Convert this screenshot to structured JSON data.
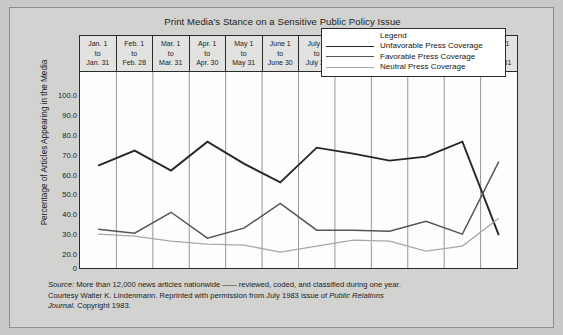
{
  "chart_data": {
    "type": "line",
    "title": "Print Media's Stance on a Sensitive Public Policy Issue",
    "xlabel": "",
    "ylabel": "Percentage of Articles Appearing in the Media",
    "ylim": [
      0,
      100
    ],
    "yticks": [
      "0",
      "20.0",
      "30.0",
      "40.0",
      "50.0",
      "60.0",
      "70.0",
      "80.0",
      "90.0",
      "100.0"
    ],
    "grid": "vertical",
    "legend_position": "inside-top-right",
    "legend_title": "Legend",
    "categories": [
      "Jan. 1 to Jan. 31",
      "Feb. 1 to Feb. 28",
      "Mar. 1 to Mar. 31",
      "Apr. 1 to Apr. 30",
      "May 1 to May 31",
      "June 1 to June 30",
      "July 1 to July 31",
      "Aug. 1 to Aug. 31",
      "Sept. 1 to Sept. 30",
      "Oct. 1 to Oct. 31",
      "Nov. 1 to Nov. 30",
      "Dec. 1 to Dec. 31"
    ],
    "series": [
      {
        "name": "Unfavorable Press Coverage",
        "color": "#262626",
        "values": [
          65.0,
          72.5,
          62.5,
          77.0,
          66.0,
          56.5,
          74.0,
          71.0,
          67.5,
          69.5,
          77.0,
          30.0
        ]
      },
      {
        "name": "Favorable Press Coverage",
        "color": "#545454",
        "values": [
          33.0,
          31.0,
          41.5,
          28.5,
          33.5,
          46.0,
          32.5,
          32.5,
          32.0,
          37.0,
          30.5,
          67.0
        ]
      },
      {
        "name": "Neutral Press Coverage",
        "color": "#a8a8a8",
        "values": [
          30.5,
          29.5,
          27.0,
          25.5,
          25.0,
          21.5,
          24.5,
          27.5,
          27.0,
          22.0,
          24.5,
          38.5
        ]
      }
    ]
  },
  "header": {
    "months": [
      {
        "line1": "Jan. 1",
        "line2": "to",
        "line3": "Jan. 31"
      },
      {
        "line1": "Feb. 1",
        "line2": "to",
        "line3": "Feb. 28"
      },
      {
        "line1": "Mar. 1",
        "line2": "to",
        "line3": "Mar. 31"
      },
      {
        "line1": "Apr. 1",
        "line2": "to",
        "line3": "Apr. 30"
      },
      {
        "line1": "May 1",
        "line2": "to",
        "line3": "May 31"
      },
      {
        "line1": "June 1",
        "line2": "to",
        "line3": "June 30"
      },
      {
        "line1": "July 1",
        "line2": "to",
        "line3": "July 31"
      },
      {
        "line1": "Aug. 1",
        "line2": "to",
        "line3": "Aug. 31"
      },
      {
        "line1": "Sept. 1",
        "line2": "to",
        "line3": "Sept. 30"
      },
      {
        "line1": "Oct. 1",
        "line2": "to",
        "line3": "Oct. 31"
      },
      {
        "line1": "Nov. 1",
        "line2": "to",
        "line3": "Nov. 30"
      },
      {
        "line1": "Dec. 1",
        "line2": "to",
        "line3": "Dec. 31"
      }
    ]
  },
  "source": {
    "line1_lead": "Source:",
    "line1_a": " More than 12,000 news articles nationwide ",
    "line1_dash": "——",
    "line1_b": " reviewed, coded, and classified during one year.",
    "line2_a": "Courtesy Walter K. Lindenmann. Reprinted with permission from July 1983 issue of ",
    "line2_ital": "Public Relations",
    "line3_ital": "Journal.",
    "line3_b": " Copyright 1983."
  },
  "colors": {
    "figure_background": "#d2d2d0",
    "plot_background": "#fdfdfb",
    "axis": "#2b2b2b",
    "gridline": "#7c7c7c",
    "unfavorable": "#262626",
    "favorable": "#545454",
    "neutral": "#a8a8a8"
  }
}
